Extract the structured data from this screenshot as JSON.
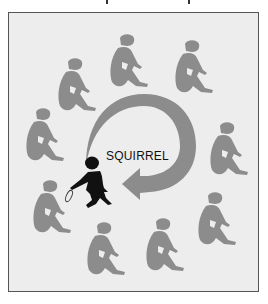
{
  "diagram": {
    "label": "SQUIRREL",
    "colors": {
      "background": "#ededed",
      "frame_border": "#555555",
      "figure_gray": "#8c8c8c",
      "arrow_gray": "#8c8c8c",
      "squirrel_black": "#111111"
    },
    "seated_figures": [
      {
        "x": 58,
        "y": 58
      },
      {
        "x": 110,
        "y": 34
      },
      {
        "x": 175,
        "y": 40
      },
      {
        "x": 26,
        "y": 108
      },
      {
        "x": 210,
        "y": 122
      },
      {
        "x": 33,
        "y": 180
      },
      {
        "x": 198,
        "y": 192
      },
      {
        "x": 87,
        "y": 222
      },
      {
        "x": 146,
        "y": 218
      }
    ],
    "arrow": {
      "center_x": 142,
      "center_y": 145,
      "radius": 48,
      "direction": "clockwise"
    },
    "squirrel_figure": {
      "x": 78,
      "y": 158
    },
    "dropped_object": {
      "x": 66,
      "y": 192
    }
  }
}
